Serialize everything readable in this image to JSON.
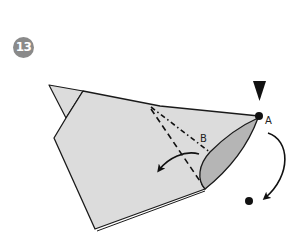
{
  "step": {
    "number": "13"
  },
  "labels": {
    "point_a": "A",
    "point_b": "B"
  },
  "colors": {
    "paper": "#dcdcdc",
    "flap": "#b5b5b5",
    "outline": "#1a1a1a",
    "badge": "#8a8a8a"
  },
  "symbols": {
    "push_arrow": "push-down-triangle",
    "mountain_fold": "dash-dot-line",
    "valley_fold": "dashed-line",
    "fold_arrow": "curved-arrow",
    "swing_arrow": "curved-arrow"
  }
}
